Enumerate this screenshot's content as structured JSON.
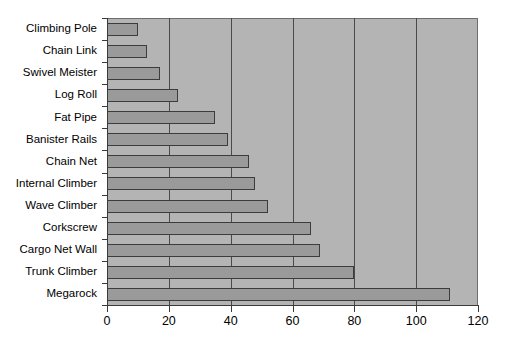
{
  "chart_data": {
    "type": "bar",
    "orientation": "horizontal",
    "title": "",
    "subtitle": "",
    "xlabel": "",
    "ylabel": "",
    "categories": [
      "Climbing Pole",
      "Chain Link",
      "Swivel Meister",
      "Log Roll",
      "Fat Pipe",
      "Banister Rails",
      "Chain Net",
      "Internal Climber",
      "Wave Climber",
      "Corkscrew",
      "Cargo Net Wall",
      "Trunk Climber",
      "Megarock"
    ],
    "values": [
      10,
      13,
      17,
      23,
      35,
      39,
      46,
      48,
      52,
      66,
      69,
      80,
      111
    ],
    "xlim": [
      0,
      120
    ],
    "xticks": [
      0,
      20,
      40,
      60,
      80,
      100,
      120
    ],
    "xtick_labels": [
      "0",
      "20",
      "40",
      "60",
      "80",
      "100",
      "120"
    ],
    "gridlines": [
      20,
      40,
      60,
      80,
      100
    ],
    "grid": true,
    "legend": null,
    "legend_position": "none",
    "annotations": []
  },
  "style": {
    "plot_background": "#b4b4b4",
    "figure_background": "#ffffff",
    "bar_fill": "#9a9a9a",
    "bar_border": "#3c3c3c",
    "gridline_color": "#4a4a4a",
    "axis_color": "#3a3a3a",
    "text_color": "#000000"
  }
}
